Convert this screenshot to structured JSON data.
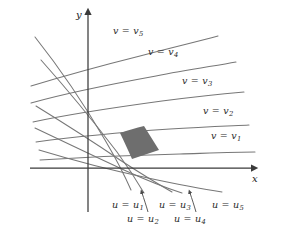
{
  "figure": {
    "background_color": "#ffffff",
    "curve_color": "#777777",
    "axis_color": "#3a3a3a",
    "shaded_region_color": "#6e6e6e",
    "text_color": "#2b2b2b"
  },
  "axes": {
    "x_label": "x",
    "y_label": "y",
    "x_axis": {
      "x1": 30,
      "y1": 168,
      "x2": 252,
      "y2": 168
    },
    "y_axis": {
      "x1": 88,
      "y1": 212,
      "x2": 88,
      "y2": 14
    },
    "x_label_pos": {
      "x": 252,
      "y": 174
    },
    "y_label_pos": {
      "x": 76,
      "y": 10
    }
  },
  "v_curves": {
    "note": "Level curves of constant v; arcs sweeping from lower-left to upper-right",
    "labels": [
      {
        "text": "v = v",
        "sub": "5",
        "x": 113,
        "y": 26
      },
      {
        "text": "v = v",
        "sub": "4",
        "x": 148,
        "y": 47
      },
      {
        "text": "v = v",
        "sub": "3",
        "x": 182,
        "y": 76
      },
      {
        "text": "v = v",
        "sub": "2",
        "x": 203,
        "y": 106
      },
      {
        "text": "v = v",
        "sub": "1",
        "x": 211,
        "y": 131
      }
    ],
    "paths": [
      "M 31,103 C 70,92 112,84 156,76 C 186,70 214,66 236,62",
      "M 31,86 C 64,76 100,66 140,56 C 170,48 196,42 218,36",
      "M 33,122 C 74,113 118,107 162,101 C 193,97 221,94 244,92",
      "M 36,142 C 80,136 126,132 170,129 C 202,127 228,126 249,125",
      "M 40,160 C 88,157 136,155 180,154 C 212,153 238,152 255,152"
    ]
  },
  "u_curves": {
    "note": "Level curves of constant u; arcs sweeping from upper-left down to lower-right",
    "labels": [
      {
        "text": "u = u",
        "sub": "1",
        "x": 112,
        "y": 200,
        "arrow": false
      },
      {
        "text": "u = u",
        "sub": "2",
        "x": 127,
        "y": 214,
        "arrow": true,
        "arrow_path": "M 148,212 C 146,205 144,199 142,193"
      },
      {
        "text": "u = u",
        "sub": "3",
        "x": 159,
        "y": 200,
        "arrow": false
      },
      {
        "text": "u = u",
        "sub": "4",
        "x": 174,
        "y": 214,
        "arrow": true,
        "arrow_path": "M 196,212 C 194,205 192,199 190,193"
      },
      {
        "text": "u = u",
        "sub": "5",
        "x": 212,
        "y": 200,
        "arrow": false
      }
    ],
    "paths": [
      "M 35,37 C 58,66 84,104 105,140 C 115,157 124,174 131,190",
      "M 41,60 C 66,88 94,122 117,152 C 128,167 137,181 144,193",
      "M 36,106 C 62,122 92,141 120,160 C 140,173 158,184 172,192",
      "M 35,128 C 62,141 94,156 124,170 C 146,180 166,188 182,193",
      "M 39,150 C 72,160 110,170 148,178 C 176,184 202,189 222,192"
    ]
  },
  "shaded_region": {
    "note": "Highlighted coordinate cell bounded by adjacent u and v curves",
    "path": "M 120,133 C 128,130 136,128 144,126 C 149,134 154,142 159,150 C 150,153 141,156 132,159 C 128,150 124,141 120,133 Z",
    "color": "#6e6e6e"
  }
}
